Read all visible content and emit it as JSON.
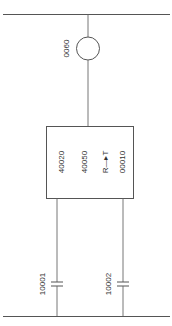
{
  "diagram": {
    "type": "single-line electrical schematic",
    "colors": {
      "line": "#555555",
      "text": "#333333",
      "background": "#ffffff"
    },
    "top_bus": {
      "label": ""
    },
    "meter": {
      "label": "0060",
      "icon": "circle-meter-icon"
    },
    "device_box": {
      "labels": [
        "40020",
        "40050",
        "R—▸T",
        "00010"
      ]
    },
    "capacitors": [
      {
        "label": "10001"
      },
      {
        "label": "10002"
      }
    ],
    "bottom_bus": {
      "label": ""
    }
  }
}
